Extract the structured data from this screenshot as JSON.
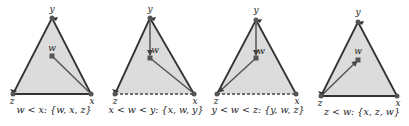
{
  "diagrams": [
    {
      "caption": "w < x: {w, x, z}",
      "labels": {
        "y": "y",
        "w": "w",
        "z": "z",
        "x": "x"
      }
    },
    {
      "caption": "x < w < y: {x, w, y}",
      "labels": {
        "y": "y",
        "w": "w",
        "z": "z",
        "x": "x"
      }
    },
    {
      "caption": "y < w < z: {y, w, z}",
      "labels": {
        "y": "y",
        "w": "w",
        "z": "z",
        "x": "x"
      }
    },
    {
      "caption": "z < w: {x, z, w}",
      "labels": {
        "y": "y",
        "w": "w",
        "z": "z",
        "x": "x"
      }
    }
  ],
  "colors": {
    "fill": "#dcdcdc",
    "edge": "#333333",
    "inner_edge": "#555555",
    "vertex": "#555555"
  }
}
